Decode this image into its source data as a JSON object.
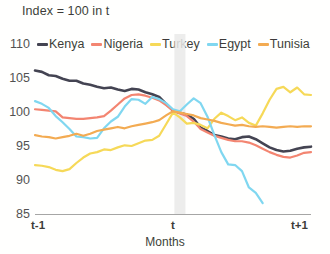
{
  "chart_data": {
    "type": "line",
    "title": "Index = 100 in t",
    "xlabel": "Months",
    "ylabel": "",
    "ylim": [
      85,
      110
    ],
    "yticks": [
      110,
      105,
      100,
      95,
      90,
      85
    ],
    "xticks": [
      "t-1",
      "t",
      "t+1"
    ],
    "grid": false,
    "legend_position": "top",
    "annotations": [
      {
        "name": "event-band",
        "label": "t",
        "x_start": 0.505,
        "x_end": 0.545,
        "color": "#e8e8e8"
      }
    ],
    "x_note": "x values normalized 0 = t-1, 0.5 = t, 1 = t+1",
    "series": [
      {
        "name": "Kenya",
        "color": "#2b2b3c",
        "x": [
          0,
          0.025,
          0.05,
          0.075,
          0.1,
          0.125,
          0.15,
          0.175,
          0.2,
          0.225,
          0.25,
          0.275,
          0.3,
          0.325,
          0.35,
          0.375,
          0.4,
          0.425,
          0.45,
          0.475,
          0.5,
          0.525,
          0.55,
          0.575,
          0.6,
          0.625,
          0.65,
          0.675,
          0.7,
          0.725,
          0.75,
          0.775,
          0.8,
          0.825,
          0.85,
          0.875,
          0.9,
          0.925,
          0.95,
          0.975,
          1.0
        ],
        "values": [
          106.1,
          105.9,
          105.4,
          105.3,
          104.9,
          104.6,
          104.6,
          104.2,
          104.0,
          103.7,
          103.5,
          103.6,
          103.3,
          103.1,
          103.4,
          103.3,
          102.9,
          102.6,
          102.2,
          101.2,
          100.2,
          99.9,
          99.6,
          99.0,
          97.7,
          97.2,
          96.6,
          96.4,
          96.1,
          96.0,
          96.3,
          96.4,
          96.0,
          95.4,
          94.8,
          94.4,
          94.2,
          94.3,
          94.6,
          94.8,
          94.9
        ]
      },
      {
        "name": "Nigeria",
        "color": "#f2755f",
        "x": [
          0,
          0.025,
          0.05,
          0.075,
          0.1,
          0.125,
          0.15,
          0.175,
          0.2,
          0.225,
          0.25,
          0.275,
          0.3,
          0.325,
          0.35,
          0.375,
          0.4,
          0.425,
          0.45,
          0.475,
          0.5,
          0.525,
          0.55,
          0.575,
          0.6,
          0.625,
          0.65,
          0.675,
          0.7,
          0.725,
          0.75,
          0.775,
          0.8,
          0.825,
          0.85,
          0.875,
          0.9,
          0.925,
          0.95,
          0.975,
          1.0
        ],
        "values": [
          100.4,
          100.3,
          100.2,
          100.1,
          99.2,
          99.1,
          99.0,
          99.0,
          99.1,
          99.2,
          99.4,
          100.2,
          101.1,
          102.0,
          102.5,
          102.6,
          102.4,
          102.1,
          101.7,
          101.0,
          100.2,
          99.8,
          99.4,
          98.6,
          97.5,
          97.0,
          96.5,
          96.2,
          95.9,
          95.7,
          95.7,
          95.5,
          95.1,
          94.6,
          94.1,
          93.7,
          93.4,
          93.3,
          93.6,
          94.0,
          94.1
        ]
      },
      {
        "name": "Turkey",
        "color": "#f5d442",
        "x": [
          0,
          0.025,
          0.05,
          0.075,
          0.1,
          0.125,
          0.15,
          0.175,
          0.2,
          0.225,
          0.25,
          0.275,
          0.3,
          0.325,
          0.35,
          0.375,
          0.4,
          0.425,
          0.45,
          0.475,
          0.5,
          0.525,
          0.55,
          0.575,
          0.6,
          0.625,
          0.65,
          0.675,
          0.7,
          0.725,
          0.75,
          0.775,
          0.8,
          0.825,
          0.85,
          0.875,
          0.9,
          0.925,
          0.95,
          0.975,
          1.0
        ],
        "values": [
          92.2,
          92.1,
          91.9,
          91.5,
          91.3,
          91.6,
          92.5,
          93.3,
          93.9,
          94.1,
          94.5,
          94.4,
          94.8,
          95.1,
          95.0,
          95.4,
          95.8,
          95.9,
          96.5,
          98.2,
          99.9,
          99.2,
          98.3,
          98.4,
          98.1,
          97.6,
          99.0,
          99.9,
          99.4,
          98.8,
          99.2,
          98.4,
          98.0,
          99.8,
          101.8,
          103.4,
          103.7,
          102.9,
          103.6,
          102.6,
          102.5
        ]
      },
      {
        "name": "Egypt",
        "color": "#6fd2f0",
        "x": [
          0,
          0.025,
          0.05,
          0.075,
          0.1,
          0.125,
          0.15,
          0.175,
          0.2,
          0.225,
          0.25,
          0.275,
          0.3,
          0.325,
          0.35,
          0.375,
          0.4,
          0.425,
          0.45,
          0.475,
          0.5,
          0.525,
          0.55,
          0.575,
          0.6,
          0.625,
          0.65,
          0.675,
          0.7,
          0.725,
          0.75,
          0.775,
          0.8,
          0.825
        ],
        "values": [
          101.6,
          101.2,
          100.6,
          99.4,
          98.5,
          97.5,
          96.4,
          96.3,
          96.1,
          96.2,
          97.6,
          98.6,
          99.3,
          100.8,
          101.9,
          101.8,
          101.2,
          102.2,
          101.9,
          101.3,
          100.4,
          100.1,
          101.1,
          102.0,
          101.3,
          99.3,
          96.6,
          94.1,
          92.3,
          92.2,
          91.3,
          88.9,
          88.1,
          86.6
        ]
      },
      {
        "name": "Tunisia",
        "color": "#f2a03c",
        "x": [
          0,
          0.025,
          0.05,
          0.075,
          0.1,
          0.125,
          0.15,
          0.175,
          0.2,
          0.225,
          0.25,
          0.275,
          0.3,
          0.325,
          0.35,
          0.375,
          0.4,
          0.425,
          0.45,
          0.475,
          0.5,
          0.525,
          0.55,
          0.575,
          0.6,
          0.625,
          0.65,
          0.675,
          0.7,
          0.725,
          0.75,
          0.775,
          0.8,
          0.825,
          0.85,
          0.875,
          0.9,
          0.925,
          0.95,
          0.975,
          1.0
        ],
        "values": [
          96.6,
          96.4,
          96.3,
          96.1,
          96.3,
          96.5,
          96.8,
          96.5,
          96.8,
          97.2,
          97.4,
          97.6,
          97.8,
          97.6,
          97.9,
          98.1,
          98.3,
          98.5,
          98.8,
          99.5,
          100.1,
          99.9,
          99.7,
          99.5,
          99.1,
          98.9,
          98.7,
          98.4,
          98.2,
          98.0,
          98.1,
          97.9,
          97.8,
          97.9,
          97.8,
          97.7,
          97.8,
          97.9,
          97.8,
          97.9,
          97.9
        ]
      }
    ]
  },
  "legend": {
    "items": [
      {
        "label": "Kenya",
        "color": "#2b2b3c"
      },
      {
        "label": "Nigeria",
        "color": "#f2755f"
      },
      {
        "label": "Turkey",
        "color": "#f5d442"
      },
      {
        "label": "Egypt",
        "color": "#6fd2f0"
      },
      {
        "label": "Tunisia",
        "color": "#f2a03c"
      }
    ]
  },
  "axes": {
    "y_labels": [
      "110",
      "105",
      "100",
      "95",
      "90",
      "85"
    ],
    "x_labels": [
      "t-1",
      "t",
      "t+1"
    ],
    "x_title": "Months"
  }
}
